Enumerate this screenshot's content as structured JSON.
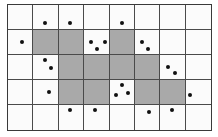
{
  "grid": {
    "rows": 5,
    "cols": 8,
    "colors": {
      "shaded": "#a9a9a9",
      "empty": "#fbfbfb",
      "line": "#4a4a4a",
      "dot": "#111111"
    },
    "cells": [
      [
        0,
        0,
        0,
        0,
        0,
        0,
        0,
        0
      ],
      [
        0,
        1,
        1,
        0,
        1,
        0,
        0,
        0
      ],
      [
        0,
        0,
        1,
        1,
        1,
        1,
        0,
        0
      ],
      [
        0,
        0,
        1,
        1,
        0,
        1,
        1,
        0
      ],
      [
        0,
        0,
        0,
        0,
        0,
        0,
        0,
        0
      ]
    ],
    "dots": [
      {
        "x": 45,
        "y": 23
      },
      {
        "x": 70,
        "y": 23
      },
      {
        "x": 122,
        "y": 23
      },
      {
        "x": 22,
        "y": 42
      },
      {
        "x": 91,
        "y": 42
      },
      {
        "x": 105,
        "y": 42
      },
      {
        "x": 97,
        "y": 49
      },
      {
        "x": 142,
        "y": 42
      },
      {
        "x": 148,
        "y": 49
      },
      {
        "x": 45,
        "y": 60
      },
      {
        "x": 51,
        "y": 68
      },
      {
        "x": 168,
        "y": 67
      },
      {
        "x": 175,
        "y": 73
      },
      {
        "x": 49,
        "y": 92
      },
      {
        "x": 122,
        "y": 85
      },
      {
        "x": 116,
        "y": 95
      },
      {
        "x": 128,
        "y": 93
      },
      {
        "x": 190,
        "y": 95
      },
      {
        "x": 70,
        "y": 110
      },
      {
        "x": 95,
        "y": 110
      },
      {
        "x": 149,
        "y": 112
      },
      {
        "x": 172,
        "y": 110
      }
    ]
  }
}
